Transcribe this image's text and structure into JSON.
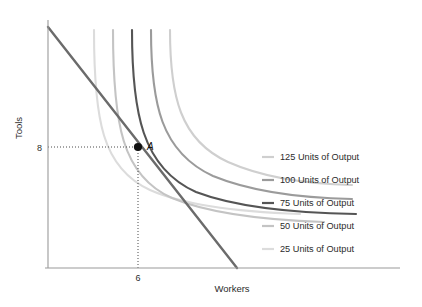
{
  "chart_data": {
    "type": "line",
    "title": "",
    "xlabel": "Workers",
    "ylabel": "Tools",
    "grid": false,
    "legend_position": "right",
    "xlim": [
      0,
      20
    ],
    "ylim": [
      0,
      20
    ],
    "xticks": [
      "6"
    ],
    "yticks": [
      "8"
    ],
    "annotations": [
      {
        "label": "A",
        "x": 6,
        "y": 8,
        "note": "tangency point of isocost line and 75-unit isoquant"
      }
    ],
    "series": [
      {
        "name": "25 Units of Output",
        "color": "#dcdcdc",
        "type": "isoquant",
        "path": "M 94 30 C 94 120, 102 168, 150 190 C 186 206, 240 212, 300 214"
      },
      {
        "name": "50 Units of Output",
        "color": "#c4c4c4",
        "type": "isoquant",
        "path": "M 113 30 C 113 124, 122 176, 172 198 C 210 214, 264 220, 324 222"
      },
      {
        "name": "75 Units of Output",
        "color": "#555555",
        "type": "isoquant",
        "path": "M 132 30 C 132 112, 142 168, 196 192 C 238 208, 296 213, 356 214"
      },
      {
        "name": "100 Units of Output",
        "color": "#9b9b9b",
        "type": "isoquant",
        "path": "M 151 30 C 151 104, 161 152, 213 176 C 252 192, 300 198, 352 199"
      },
      {
        "name": "125 Units of Output",
        "color": "#cfcfcf",
        "type": "isoquant",
        "path": "M 170 30 C 170 96, 180 140, 228 162 C 264 178, 306 184, 352 185"
      },
      {
        "name": "Isocost (budget) line",
        "color": "#6b6b6b",
        "type": "line",
        "path": "M 48 27 L 237 268"
      }
    ]
  },
  "axes": {
    "y_label": "Tools",
    "x_label": "Workers",
    "y_tick": "8",
    "x_tick": "6"
  },
  "point": {
    "label": "A"
  },
  "legend": {
    "items": [
      {
        "label": "125 Units of Output",
        "color": "#cfcfcf"
      },
      {
        "label": "100 Units of Output",
        "color": "#9b9b9b"
      },
      {
        "label": "75 Units of Output",
        "color": "#555555"
      },
      {
        "label": "50 Units of Output",
        "color": "#c4c4c4"
      },
      {
        "label": "25 Units of Output",
        "color": "#dcdcdc"
      }
    ]
  }
}
